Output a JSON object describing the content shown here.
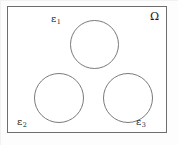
{
  "figure": {
    "name": "domain-with-three-inclusions",
    "background_color": "#ffffff",
    "line_color": "#6e6e6e",
    "text_color": "#1a1a1a"
  },
  "domain": {
    "label": "Ω",
    "label_name": "omega-label",
    "shape": "rectangle"
  },
  "inclusions": [
    {
      "id": "eps1",
      "label_base": "ε",
      "label_sub": "1",
      "shape": "circle",
      "position": "top-center"
    },
    {
      "id": "eps2",
      "label_base": "ε",
      "label_sub": "2",
      "shape": "circle",
      "position": "bottom-left"
    },
    {
      "id": "eps3",
      "label_base": "ε",
      "label_sub": "3",
      "shape": "circle",
      "position": "bottom-right"
    }
  ]
}
